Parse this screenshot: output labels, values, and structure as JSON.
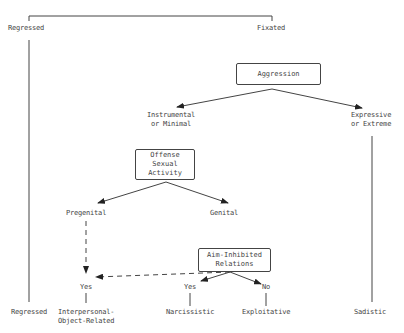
{
  "diagram": {
    "top_branches": {
      "left": "Regressed",
      "right": "Fixated"
    },
    "nodes": {
      "aggression": "Aggression",
      "instrumental": [
        "Instrumental",
        "or Minimal"
      ],
      "expressive": [
        "Expressive",
        "or Extreme"
      ],
      "offense_sexual_activity": [
        "Offense",
        "Sexual",
        "Activity"
      ],
      "pregenital": "Pregenital",
      "genital": "Genital",
      "aim_inhibited": [
        "Aim-Inhibited",
        "Relations"
      ],
      "yes_left": "Yes",
      "yes_mid": "Yes",
      "no": "No"
    },
    "outcomes": {
      "regressed": "Regressed",
      "interpersonal": [
        "Interpersonal-",
        "Object-Related"
      ],
      "narcissistic": "Narcissistic",
      "exploitative": "Exploitative",
      "sadistic": "Sadistic"
    },
    "colors": {
      "line": "#333333",
      "text": "#444444",
      "background": "#ffffff"
    }
  }
}
